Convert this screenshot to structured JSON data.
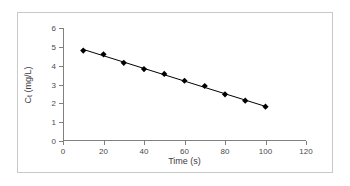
{
  "figure": {
    "border_color": "#c9c9c9",
    "background": "#ffffff",
    "axis_color": "#808080",
    "series_color": "#000000"
  },
  "chart_data": {
    "type": "line",
    "title": "",
    "xlabel": "Time (s)",
    "ylabel_main": "C",
    "ylabel_sub": "t",
    "ylabel_unit": " (mg/L)",
    "ylabel": "Ct (mg/L)",
    "x": [
      10,
      20,
      30,
      40,
      50,
      60,
      70,
      80,
      90,
      100
    ],
    "values": [
      4.8,
      4.6,
      4.15,
      3.82,
      3.56,
      3.2,
      2.92,
      2.48,
      2.14,
      1.82
    ],
    "series": [
      {
        "name": "Ct",
        "x": [
          10,
          20,
          30,
          40,
          50,
          60,
          70,
          80,
          90,
          100
        ],
        "values": [
          4.8,
          4.6,
          4.15,
          3.82,
          3.56,
          3.2,
          2.92,
          2.48,
          2.14,
          1.82
        ],
        "marker": "diamond",
        "marker_color": "#000000",
        "line_color": "#000000",
        "trendline": true
      }
    ],
    "xlim": [
      0,
      120
    ],
    "ylim": [
      0,
      6
    ],
    "xticks": [
      0,
      20,
      40,
      60,
      80,
      100,
      120
    ],
    "yticks": [
      0,
      1,
      2,
      3,
      4,
      5,
      6
    ],
    "xtick_labels": [
      "0",
      "20",
      "40",
      "60",
      "80",
      "100",
      "120"
    ],
    "ytick_labels": [
      "0",
      "1",
      "2",
      "3",
      "4",
      "5",
      "6"
    ],
    "grid": false,
    "legend": false,
    "legend_position": "none"
  }
}
